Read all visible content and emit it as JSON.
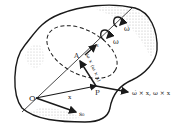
{
  "diagram": {
    "title": "",
    "type": "rigid body rotation kinematics",
    "colors": {
      "stroke": "#1a1a1a",
      "shade": "#b8b8b8",
      "background": "#ffffff"
    },
    "points": {
      "O": {
        "label": "O"
      },
      "A": {
        "label": "A"
      },
      "P": {
        "label": "P"
      }
    },
    "labels": {
      "x_vector": "x",
      "s0_vector": "s₀",
      "omega": "ω",
      "omega_dot": "ω̇",
      "s_axis": "s",
      "centripetal": "ω × (ω × x)",
      "tangential": "ω̇ × x, ω × x"
    }
  }
}
